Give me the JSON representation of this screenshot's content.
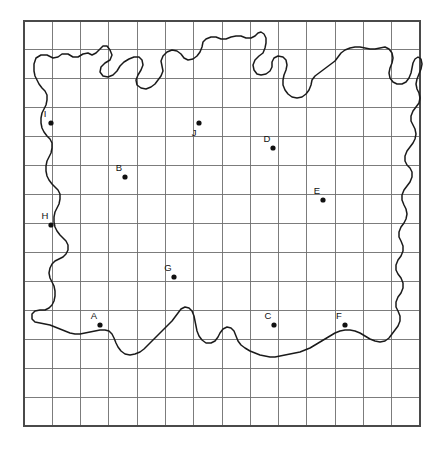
{
  "figure": {
    "background_color": "#ffffff",
    "outline_color": "#1a1a1a",
    "grid_color": "#6e6e6e",
    "grid_border_color": "#4a4a4a",
    "point_color": "#111111"
  },
  "grid": {
    "x0": 24,
    "y0": 21,
    "x1": 420,
    "y1": 426,
    "columns": 14,
    "rows": 14,
    "cell_width": 28.29,
    "cell_height": 28.93,
    "show_grid": true
  },
  "points": [
    {
      "id": "A",
      "label": "A",
      "x": 100,
      "y": 325,
      "label_x": 94,
      "label_y": 319
    },
    {
      "id": "B",
      "label": "B",
      "x": 125,
      "y": 177,
      "label_x": 119,
      "label_y": 171
    },
    {
      "id": "C",
      "label": "C",
      "x": 274,
      "y": 325,
      "label_x": 268,
      "label_y": 319
    },
    {
      "id": "D",
      "label": "D",
      "x": 273,
      "y": 148,
      "label_x": 267,
      "label_y": 142
    },
    {
      "id": "E",
      "label": "E",
      "x": 323,
      "y": 200,
      "label_x": 317,
      "label_y": 194
    },
    {
      "id": "F",
      "label": "F",
      "x": 345,
      "y": 325,
      "label_x": 339,
      "label_y": 319
    },
    {
      "id": "G",
      "label": "G",
      "x": 174,
      "y": 277,
      "label_x": 168,
      "label_y": 271
    },
    {
      "id": "H",
      "label": "H",
      "x": 51,
      "y": 225,
      "label_x": 45,
      "label_y": 219
    },
    {
      "id": "I",
      "label": "I",
      "x": 51,
      "y": 123,
      "label_x": 45,
      "label_y": 117
    },
    {
      "id": "J",
      "label": "J",
      "x": 199,
      "y": 123,
      "label_x": 194,
      "label_y": 136
    }
  ],
  "coastline": {
    "name": "landmass-outline",
    "closed": true,
    "path": "M 34 64 L 36 58 L 41 55 L 47 55 L 53 58 L 58 57 L 62 54 L 68 54 L 73 57 L 78 57 L 83 54 L 88 53 L 92 55 L 96 53 L 100 49 L 103 46 L 107 46 L 110 50 L 112 55 L 110 60 L 105 63 L 101 67 L 100 72 L 103 76 L 108 77 L 113 75 L 117 71 L 120 66 L 124 62 L 129 59 L 134 57 L 139 57 L 142 60 L 143 65 L 141 70 L 138 75 L 136 80 L 137 85 L 141 88 L 146 89 L 151 87 L 155 84 L 158 80 L 161 76 L 163 71 L 162 66 L 161 61 L 163 56 L 167 52 L 172 50 L 177 51 L 181 54 L 184 58 L 188 60 L 193 59 L 197 56 L 200 52 L 202 47 L 203 42 L 206 39 L 211 37 L 216 37 L 221 39 L 226 39 L 231 37 L 236 36 L 241 36 L 246 38 L 251 38 L 255 36 L 258 33 L 261 32 L 264 34 L 266 38 L 266 43 L 265 48 L 263 53 L 259 56 L 255 60 L 253 65 L 254 70 L 257 74 L 261 75 L 266 74 L 270 71 L 272 67 L 272 62 L 274 58 L 278 56 L 283 57 L 286 60 L 287 65 L 286 70 L 284 75 L 283 80 L 283 85 L 285 90 L 288 94 L 292 97 L 297 98 L 302 97 L 306 94 L 309 90 L 311 85 L 312 80 L 315 76 L 319 73 L 323 70 L 327 67 L 331 64 L 335 61 L 338 57 L 341 53 L 345 50 L 350 48 L 355 47 L 360 47 L 365 48 L 370 49 L 375 49 L 380 48 L 385 47 L 389 49 L 392 53 L 393 58 L 392 63 L 390 68 L 389 73 L 390 78 L 393 82 L 397 84 L 402 84 L 406 82 L 409 78 L 411 73 L 412 68 L 413 63 L 415 59 L 418 57 L 421 59 L 422 64 L 421 69 L 419 74 L 417 79 L 416 84 L 417 89 L 419 93 L 420 98 L 419 103 L 416 107 L 413 111 L 411 116 L 411 121 L 413 125 L 415 129 L 416 134 L 415 139 L 413 143 L 410 147 L 407 151 L 405 156 L 405 161 L 407 165 L 410 168 L 412 172 L 412 177 L 410 182 L 407 186 L 404 190 L 402 195 L 402 200 L 404 205 L 406 209 L 407 214 L 406 219 L 404 223 L 401 227 L 399 232 L 399 237 L 401 241 L 403 246 L 403 251 L 401 256 L 398 260 L 396 265 L 396 270 L 398 274 L 401 278 L 403 283 L 403 288 L 401 293 L 398 297 L 396 302 L 396 307 L 398 311 L 400 316 L 400 321 L 398 326 L 395 330 L 392 334 L 389 338 L 385 341 L 380 342 L 375 341 L 370 339 L 365 336 L 360 333 L 355 331 L 350 330 L 345 330 L 340 331 L 335 333 L 330 336 L 325 339 L 320 342 L 315 345 L 310 348 L 305 350 L 300 352 L 295 353 L 290 354 L 285 355 L 280 356 L 275 357 L 270 357 L 265 356 L 260 355 L 255 353 L 250 351 L 245 348 L 241 345 L 238 341 L 236 336 L 234 331 L 231 328 L 227 327 L 223 329 L 220 333 L 218 337 L 215 341 L 211 343 L 206 343 L 202 340 L 199 336 L 197 331 L 196 326 L 195 321 L 194 316 L 192 311 L 189 308 L 185 307 L 181 309 L 178 313 L 175 317 L 172 321 L 168 325 L 164 329 L 160 333 L 156 337 L 152 341 L 148 345 L 144 349 L 140 352 L 135 354 L 130 355 L 125 354 L 121 351 L 118 347 L 116 343 L 114 338 L 112 334 L 109 331 L 105 330 L 100 330 L 95 331 L 90 332 L 85 333 L 80 334 L 75 334 L 70 333 L 65 331 L 60 329 L 55 327 L 50 325 L 45 324 L 40 323 L 35 322 L 32 319 L 32 314 L 35 311 L 40 310 L 45 310 L 49 308 L 52 305 L 54 301 L 55 296 L 55 291 L 54 286 L 52 282 L 50 278 L 49 273 L 50 268 L 52 264 L 55 261 L 59 259 L 63 257 L 66 254 L 68 250 L 68 245 L 66 241 L 63 238 L 60 235 L 57 231 L 55 227 L 54 222 L 54 217 L 55 212 L 57 208 L 59 204 L 60 199 L 60 194 L 58 190 L 55 187 L 52 184 L 49 180 L 47 176 L 46 171 L 46 166 L 47 161 L 49 157 L 51 153 L 52 148 L 52 143 L 50 139 L 47 136 L 44 132 L 42 128 L 41 123 L 41 118 L 42 113 L 44 109 L 46 105 L 47 100 L 47 95 L 45 91 L 42 88 L 39 84 L 37 80 L 35 76 L 34 71 Z"
  }
}
